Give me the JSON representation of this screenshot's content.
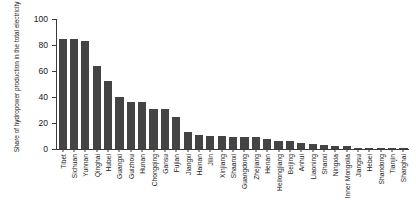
{
  "chart_data": {
    "type": "bar",
    "title": "",
    "xlabel": "",
    "ylabel": "Share of hydropower production in the total electricity production (%)",
    "ylim": [
      0,
      100
    ],
    "yticks": [
      0,
      20,
      40,
      60,
      80,
      100
    ],
    "grid": false,
    "legend": null,
    "bar_color": "#444444",
    "axis_color": "#3a3a3a",
    "categories": [
      "Tibet",
      "Sichuan",
      "Yunnan",
      "Qinghai",
      "Hubei",
      "Guangxi",
      "Guizhou",
      "Hunan",
      "Chongqing",
      "Gansu",
      "Fujian",
      "Jiangxi",
      "Hainan",
      "Jilin",
      "Xinjiang",
      "Shaanxi",
      "Guangdong",
      "Zhejiang",
      "Henan",
      "Heilongjiang",
      "Beijing",
      "Anhui",
      "Liaoning",
      "Shanxi",
      "Ningxia",
      "Inner Mongolia",
      "Jiangsu",
      "Hebei",
      "Shandong",
      "Tianjin",
      "Shanghai"
    ],
    "values": [
      85,
      85,
      83,
      64,
      52,
      40,
      36,
      36,
      31,
      31,
      25,
      13,
      11,
      10,
      10,
      9,
      9,
      9,
      8,
      6,
      6,
      5,
      4,
      3,
      2,
      2,
      1,
      1,
      0.6,
      0.4,
      0.3
    ]
  }
}
